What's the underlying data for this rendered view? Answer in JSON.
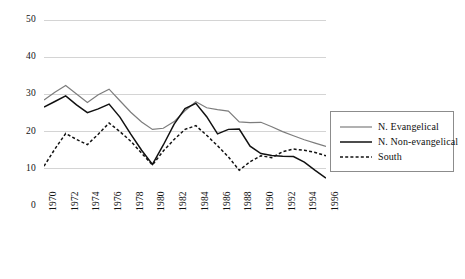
{
  "chart_data": {
    "type": "line",
    "title": "",
    "xlabel": "",
    "ylabel": "",
    "xlim": [
      1970,
      1996
    ],
    "ylim": [
      0,
      50
    ],
    "yticks": [
      0,
      10,
      20,
      30,
      40,
      50
    ],
    "grid": true,
    "legend_position": "right",
    "x": [
      1970,
      1971,
      1972,
      1973,
      1974,
      1975,
      1976,
      1977,
      1978,
      1979,
      1980,
      1981,
      1982,
      1983,
      1984,
      1985,
      1986,
      1987,
      1988,
      1989,
      1990,
      1991,
      1992,
      1993,
      1994,
      1995,
      1996
    ],
    "xtick_labels": [
      "1970",
      "1972",
      "1974",
      "1976",
      "1978",
      "1980",
      "1982",
      "1984",
      "1986",
      "1988",
      "1990",
      "1992",
      "1994",
      "1996"
    ],
    "series": [
      {
        "name": "N. Evangelical",
        "color": "#7d7d7d",
        "style": "solid",
        "values": [
          28.5,
          30.6,
          32.4,
          30.1,
          27.8,
          29.9,
          31.4,
          28.3,
          25.2,
          22.6,
          20.6,
          20.9,
          22.7,
          25.6,
          28.0,
          26.4,
          25.9,
          25.5,
          22.6,
          22.4,
          22.5,
          21.3,
          20.0,
          18.9,
          17.8,
          16.9,
          16.0
        ]
      },
      {
        "name": "N. Non-evangelical",
        "color": "#111111",
        "style": "solid",
        "values": [
          26.6,
          28.1,
          29.6,
          27.2,
          25.1,
          26.1,
          27.4,
          23.9,
          19.3,
          15.0,
          11.2,
          16.4,
          22.0,
          26.2,
          27.6,
          24.0,
          19.4,
          20.6,
          20.7,
          16.1,
          14.1,
          13.6,
          13.4,
          13.3,
          11.8,
          9.6,
          7.5
        ]
      },
      {
        "name": "South",
        "color": "#111111",
        "style": "dashed",
        "values": [
          10.7,
          15.3,
          19.5,
          17.9,
          16.5,
          19.3,
          22.3,
          20.0,
          17.4,
          14.2,
          11.0,
          14.8,
          17.9,
          20.6,
          21.6,
          19.0,
          16.2,
          13.2,
          9.6,
          11.9,
          13.5,
          13.0,
          14.6,
          15.3,
          15.0,
          14.4,
          13.5
        ]
      }
    ]
  },
  "legend": {
    "items": [
      {
        "label": "N. Evangelical"
      },
      {
        "label": "N. Non-evangelical"
      },
      {
        "label": "South"
      }
    ]
  }
}
